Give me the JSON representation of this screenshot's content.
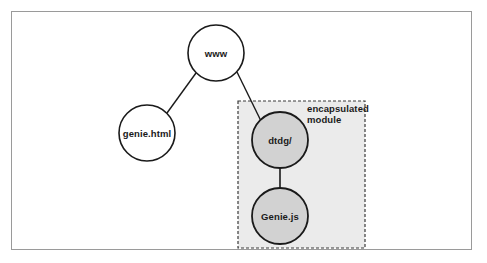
{
  "figure": {
    "type": "tree-diagram"
  },
  "frame": {
    "border_color": "#9a9a9a",
    "background": "#ffffff"
  },
  "nodes": [
    {
      "id": "www",
      "label": "www",
      "cx": 216,
      "cy": 53,
      "r": 28,
      "fill": "#ffffff",
      "stroke": "#1a1a1a"
    },
    {
      "id": "genie-html",
      "label": "genie.html",
      "cx": 147,
      "cy": 133,
      "r": 28,
      "fill": "#ffffff",
      "stroke": "#1a1a1a"
    },
    {
      "id": "dtdg",
      "label": "dtdg/",
      "cx": 280,
      "cy": 140,
      "r": 28,
      "fill": "#d2d2d2",
      "stroke": "#1a1a1a"
    },
    {
      "id": "genie-js",
      "label": "Genie.js",
      "cx": 280,
      "cy": 216,
      "r": 28,
      "fill": "#d2d2d2",
      "stroke": "#1a1a1a"
    }
  ],
  "edges": [
    {
      "id": "www-to-genie-html",
      "from": "www",
      "to": "genie-html"
    },
    {
      "id": "www-to-dtdg",
      "from": "www",
      "to": "dtdg"
    },
    {
      "id": "dtdg-to-genie-js",
      "from": "dtdg",
      "to": "genie-js"
    }
  ],
  "module_box": {
    "label_line1": "encapsulated",
    "label_line2": "module",
    "x": 238,
    "y": 101,
    "width": 127,
    "height": 147,
    "fill": "#ebebeb",
    "stroke": "#3a3a3a",
    "dash": "3,2"
  }
}
